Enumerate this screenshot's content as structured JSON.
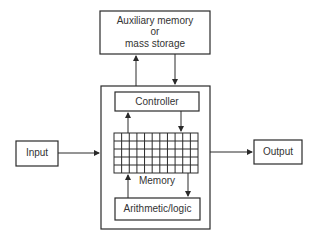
{
  "diagram": {
    "title": "",
    "nodes": {
      "aux_memory": {
        "line1": "Auxiliary memory",
        "line2": "or",
        "line3": "mass storage"
      },
      "controller": {
        "label": "Controller"
      },
      "memory": {
        "label": "Memory",
        "grid_columns": 11,
        "grid_rows": 5
      },
      "arithmetic": {
        "label": "Arithmetic/logic"
      },
      "input": {
        "label": "Input"
      },
      "output": {
        "label": "Output"
      }
    },
    "edges": [
      {
        "from": "cpu",
        "to": "aux_memory"
      },
      {
        "from": "aux_memory",
        "to": "cpu"
      },
      {
        "from": "memory",
        "to": "controller"
      },
      {
        "from": "controller",
        "to": "memory"
      },
      {
        "from": "arithmetic",
        "to": "memory"
      },
      {
        "from": "memory",
        "to": "arithmetic"
      },
      {
        "from": "input",
        "to": "cpu"
      },
      {
        "from": "cpu",
        "to": "output"
      }
    ],
    "colors": {
      "stroke": "#2a2a2a",
      "text": "#333333",
      "background": "#ffffff"
    }
  }
}
